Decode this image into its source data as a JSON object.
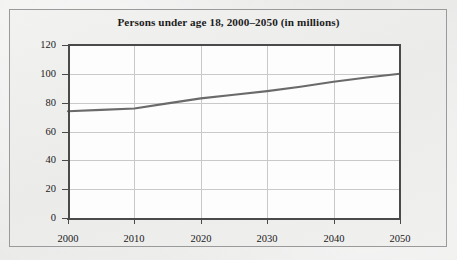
{
  "figure": {
    "title": "Persons under age 18, 2000–2050 (in millions)"
  },
  "axes": {
    "y_ticks": [
      "0",
      "20",
      "40",
      "60",
      "80",
      "100",
      "120"
    ],
    "x_ticks": [
      "2000",
      "2010",
      "2020",
      "2030",
      "2040",
      "2050"
    ]
  },
  "colors": {
    "line": "#6a6a6a",
    "grid": "#c9c9c9",
    "axis": "#4a4a4a",
    "plot_background": "#fdfdfd",
    "figure_background": "#ecebea",
    "frame_border": "#9a9a9a",
    "text": "#1d1d1d"
  },
  "chart_data": {
    "type": "line",
    "title": "Persons under age 18, 2000–2050 (in millions)",
    "xlabel": "",
    "ylabel": "",
    "xlim": [
      2000,
      2050
    ],
    "ylim": [
      0,
      120
    ],
    "grid": true,
    "legend": "none",
    "x": [
      2000,
      2005,
      2010,
      2015,
      2020,
      2025,
      2030,
      2035,
      2040,
      2045,
      2050
    ],
    "series": [
      {
        "name": "Persons under age 18 (millions)",
        "values": [
          74,
          75,
          76,
          79.5,
          83,
          85.5,
          88,
          91,
          94.5,
          97.5,
          100
        ]
      }
    ],
    "y_tick_values": [
      0,
      20,
      40,
      60,
      80,
      100,
      120
    ],
    "x_tick_values": [
      2000,
      2010,
      2020,
      2030,
      2040,
      2050
    ]
  }
}
